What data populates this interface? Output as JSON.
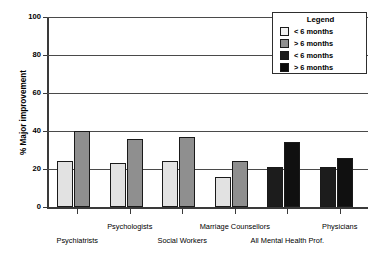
{
  "chart_data": {
    "type": "bar",
    "title": "",
    "xlabel": "",
    "ylabel": "% Major improvement",
    "ylim": [
      0,
      100
    ],
    "yticks": [
      0,
      20,
      40,
      60,
      80,
      100
    ],
    "ytick_labels": [
      "0",
      "20",
      "40",
      "60",
      "80",
      "100"
    ],
    "grid": true,
    "legend_position": "top-right",
    "categories": [
      "Psychiatrists",
      "Psychologists",
      "Social Workers",
      "Marriage Counsellors",
      "All Mental Health Prof.",
      "Physicians"
    ],
    "series": [
      {
        "name": "< 6 months",
        "values": [
          24,
          23,
          24,
          16,
          21,
          21
        ]
      },
      {
        "name": "> 6 months",
        "values": [
          40,
          36,
          37,
          24,
          34,
          26
        ]
      }
    ],
    "bar_colors_by_group": [
      [
        "#e2e2e2",
        "#8f8f8f"
      ],
      [
        "#e2e2e2",
        "#8f8f8f"
      ],
      [
        "#e2e2e2",
        "#8f8f8f"
      ],
      [
        "#e2e2e2",
        "#8f8f8f"
      ],
      [
        "#1c1c1c",
        "#101010"
      ],
      [
        "#1c1c1c",
        "#101010"
      ]
    ]
  },
  "legend": {
    "title": "Legend",
    "entries": [
      {
        "label": "< 6 months",
        "color": "#f2f2f2"
      },
      {
        "label": "> 6 months",
        "color": "#8f8f8f"
      },
      {
        "label": "< 6 months",
        "color": "#1c1c1c"
      },
      {
        "label": "> 6 months",
        "color": "#0a0a0a"
      }
    ]
  }
}
